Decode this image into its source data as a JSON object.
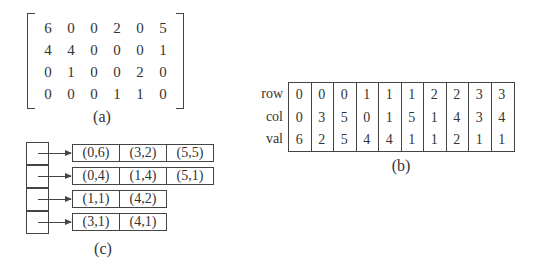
{
  "panel_a": {
    "caption": "(a)",
    "matrix": [
      [
        "6",
        "0",
        "0",
        "2",
        "0",
        "5"
      ],
      [
        "4",
        "4",
        "0",
        "0",
        "0",
        "1"
      ],
      [
        "0",
        "1",
        "0",
        "0",
        "2",
        "0"
      ],
      [
        "0",
        "0",
        "0",
        "1",
        "1",
        "0"
      ]
    ]
  },
  "panel_b": {
    "caption": "(b)",
    "row_labels": [
      "row",
      "col",
      "val"
    ],
    "row": [
      "0",
      "0",
      "0",
      "1",
      "1",
      "1",
      "2",
      "2",
      "3",
      "3"
    ],
    "col": [
      "0",
      "3",
      "5",
      "0",
      "1",
      "5",
      "1",
      "4",
      "3",
      "4"
    ],
    "val": [
      "6",
      "2",
      "5",
      "4",
      "4",
      "1",
      "1",
      "2",
      "1",
      "1"
    ]
  },
  "panel_c": {
    "caption": "(c)",
    "lists": [
      [
        "(0,6)",
        "(3,2)",
        "(5,5)"
      ],
      [
        "(0,4)",
        "(1,4)",
        "(5,1)"
      ],
      [
        "(1,1)",
        "(4,2)"
      ],
      [
        "(3,1)",
        "(4,1)"
      ]
    ]
  }
}
